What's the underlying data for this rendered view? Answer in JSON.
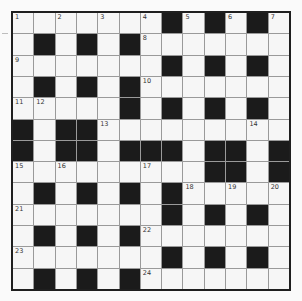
{
  "puzzle": {
    "type": "crossword",
    "rows": 13,
    "cols": 13,
    "colors": {
      "black_cell": "#1b1b1b",
      "white_cell": "#f6f6f6",
      "grid_line": "#9a9a9a",
      "border": "#1f1f1f"
    },
    "layout": [
      "WWWWWWWBWBWBW",
      "WBWBWBWWWWWWW",
      "WWWWWWWBWBWBW",
      "WBWBWBWWWWWWW",
      "WWWWWBWBWBWBW",
      "BWBBWWWWWWWWW",
      "BWBBWBBBWBBWB",
      "WWWWWWWWWBBWB",
      "WBWBWBWBWWWWW",
      "WWWWWWWBWBWBW",
      "WBWBWBWWWWWWW",
      "WWWWWWWBWBWBW",
      "WBWBWBWWWWWWW"
    ],
    "numbers": [
      {
        "row": 0,
        "col": 0,
        "n": "1"
      },
      {
        "row": 0,
        "col": 2,
        "n": "2"
      },
      {
        "row": 0,
        "col": 4,
        "n": "3"
      },
      {
        "row": 0,
        "col": 6,
        "n": "4"
      },
      {
        "row": 0,
        "col": 8,
        "n": "5"
      },
      {
        "row": 0,
        "col": 10,
        "n": "6"
      },
      {
        "row": 0,
        "col": 12,
        "n": "7"
      },
      {
        "row": 1,
        "col": 6,
        "n": "8"
      },
      {
        "row": 2,
        "col": 0,
        "n": "9"
      },
      {
        "row": 3,
        "col": 6,
        "n": "10"
      },
      {
        "row": 4,
        "col": 0,
        "n": "11"
      },
      {
        "row": 4,
        "col": 1,
        "n": "12"
      },
      {
        "row": 5,
        "col": 4,
        "n": "13"
      },
      {
        "row": 5,
        "col": 11,
        "n": "14"
      },
      {
        "row": 7,
        "col": 0,
        "n": "15"
      },
      {
        "row": 7,
        "col": 2,
        "n": "16"
      },
      {
        "row": 7,
        "col": 6,
        "n": "17"
      },
      {
        "row": 8,
        "col": 8,
        "n": "18"
      },
      {
        "row": 8,
        "col": 10,
        "n": "19"
      },
      {
        "row": 8,
        "col": 12,
        "n": "20"
      },
      {
        "row": 9,
        "col": 0,
        "n": "21"
      },
      {
        "row": 10,
        "col": 6,
        "n": "22"
      },
      {
        "row": 11,
        "col": 0,
        "n": "23"
      },
      {
        "row": 12,
        "col": 6,
        "n": "24"
      }
    ]
  }
}
